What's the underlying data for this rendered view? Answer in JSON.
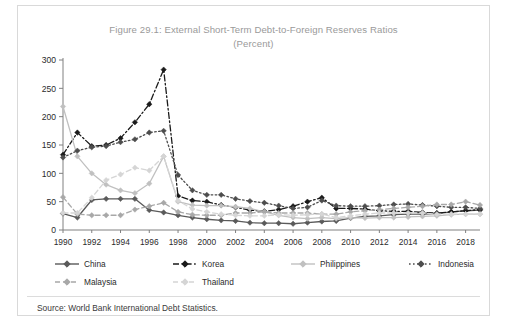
{
  "figure": {
    "title_line1": "Figure 29.1: External Short-Term Debt-to-Foreign Reserves Ratios",
    "title_line2": "(Percent)",
    "source": "Source: World Bank International Debt Statistics."
  },
  "colors": {
    "china": "#5a5a5a",
    "korea": "#1a1a1a",
    "philippines": "#c0c0c0",
    "indonesia": "#4d4d4d",
    "malaysia": "#a8a8a8",
    "thailand": "#d5d5d5",
    "axis": "#808080",
    "title_text": "#9a9a9a",
    "tick_text": "#2b2b2b",
    "frame": "#d9d9d9"
  },
  "chart_data": {
    "type": "line",
    "title": "Figure 29.1: External Short-Term Debt-to-Foreign Reserves Ratios (Percent)",
    "xlabel": "",
    "ylabel": "",
    "ylim": [
      0,
      300
    ],
    "ytick_step": 50,
    "yticks": [
      0,
      50,
      100,
      150,
      200,
      250,
      300
    ],
    "xlim": [
      1990,
      2019
    ],
    "xticks": [
      1990,
      1992,
      1994,
      1996,
      1998,
      2000,
      2002,
      2004,
      2006,
      2008,
      2010,
      2012,
      2014,
      2016,
      2018
    ],
    "x": [
      1990,
      1991,
      1992,
      1993,
      1994,
      1995,
      1996,
      1997,
      1998,
      1999,
      2000,
      2001,
      2002,
      2003,
      2004,
      2005,
      2006,
      2007,
      2008,
      2009,
      2010,
      2011,
      2012,
      2013,
      2014,
      2015,
      2016,
      2017,
      2018,
      2019
    ],
    "grid": false,
    "legend_position": "bottom",
    "series": [
      {
        "name": "China",
        "key": "china",
        "dash": "none",
        "values": [
          29,
          22,
          53,
          55,
          55,
          55,
          35,
          31,
          26,
          22,
          19,
          17,
          16,
          13,
          12,
          12,
          11,
          13,
          15,
          16,
          21,
          24,
          25,
          27,
          28,
          28,
          29,
          32,
          34,
          35
        ]
      },
      {
        "name": "Korea",
        "key": "korea",
        "dash": "dashdot",
        "values": [
          133,
          172,
          148,
          150,
          162,
          190,
          222,
          283,
          60,
          52,
          50,
          44,
          40,
          35,
          33,
          36,
          42,
          50,
          57,
          38,
          38,
          37,
          34,
          33,
          33,
          31,
          30,
          32,
          34,
          36
        ]
      },
      {
        "name": "Philippines",
        "key": "philippines",
        "dash": "none",
        "values": [
          218,
          130,
          100,
          80,
          70,
          65,
          82,
          130,
          50,
          44,
          43,
          43,
          41,
          38,
          32,
          26,
          22,
          20,
          22,
          20,
          22,
          21,
          22,
          22,
          23,
          24,
          25,
          27,
          28,
          28
        ]
      },
      {
        "name": "Indonesia",
        "key": "indonesia",
        "dash": "dot",
        "values": [
          128,
          140,
          146,
          148,
          155,
          160,
          172,
          175,
          97,
          70,
          62,
          62,
          55,
          51,
          48,
          43,
          38,
          40,
          52,
          43,
          42,
          42,
          43,
          45,
          46,
          44,
          42,
          40,
          40,
          38
        ]
      },
      {
        "name": "Malaysia",
        "key": "malaysia",
        "dash": "dash",
        "values": [
          58,
          28,
          26,
          26,
          26,
          36,
          42,
          48,
          32,
          27,
          26,
          26,
          30,
          30,
          32,
          30,
          30,
          30,
          28,
          28,
          32,
          34,
          36,
          38,
          40,
          42,
          45,
          45,
          50,
          44
        ]
      },
      {
        "name": "Thailand",
        "key": "thailand",
        "dash": "dash",
        "values": [
          30,
          30,
          57,
          88,
          98,
          110,
          105,
          130,
          52,
          37,
          32,
          28,
          26,
          25,
          25,
          27,
          26,
          27,
          28,
          22,
          25,
          28,
          30,
          30,
          30,
          30,
          28,
          28,
          28,
          28
        ]
      }
    ]
  },
  "legend": {
    "items": [
      {
        "label": "China",
        "key": "china"
      },
      {
        "label": "Korea",
        "key": "korea"
      },
      {
        "label": "Philippines",
        "key": "philippines"
      },
      {
        "label": "Indonesia",
        "key": "indonesia"
      },
      {
        "label": "Malaysia",
        "key": "malaysia"
      },
      {
        "label": "Thailand",
        "key": "thailand"
      }
    ]
  }
}
